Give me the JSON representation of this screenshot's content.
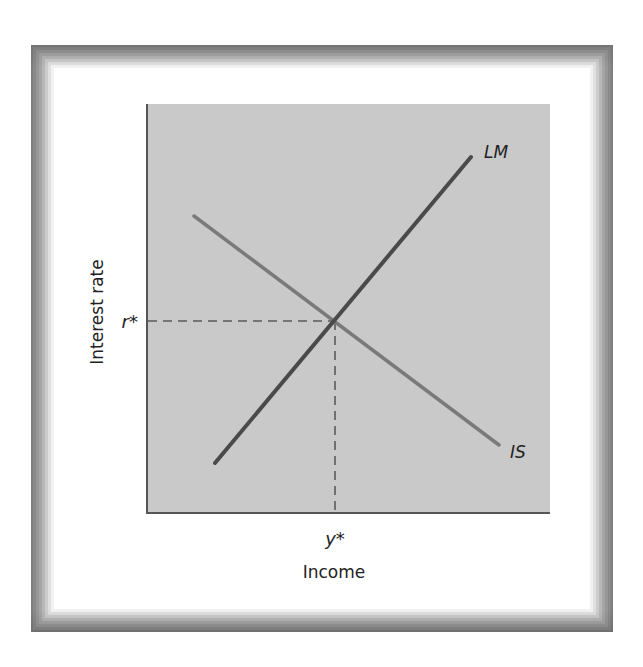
{
  "diagram": {
    "type": "economic-equilibrium",
    "colors": {
      "plot_background": "#c9c9c9",
      "axis": "#555555",
      "lm_curve": "#4a4a4a",
      "is_curve": "#7a7a7a",
      "dashed_guides": "#5a5a5a",
      "frame_outer": "#7d7d7d",
      "text": "#222222"
    },
    "axes": {
      "x_label": "Income",
      "y_label": "Interest rate"
    },
    "curves": [
      {
        "name": "LM",
        "label": "LM",
        "slope": "upward"
      },
      {
        "name": "IS",
        "label": "IS",
        "slope": "downward"
      }
    ],
    "equilibrium": {
      "x_label": "y*",
      "y_label": "r*"
    }
  }
}
